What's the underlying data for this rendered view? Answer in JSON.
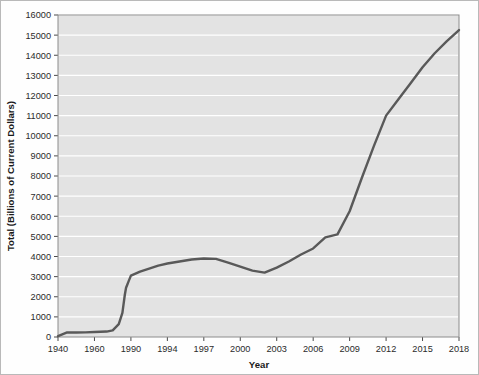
{
  "chart_data": {
    "type": "line",
    "title": "",
    "xlabel": "Year",
    "ylabel": "Total (Billions of Current Dollars)",
    "xlim": [
      1940,
      2019
    ],
    "ylim": [
      0,
      16000
    ],
    "grid": true,
    "legend": "none",
    "line_color": "#595959",
    "plot_bg_color": "#e3e3e3",
    "grid_color": "#ffffff",
    "frame_color": "#b9b9b9",
    "y_ticks": [
      0,
      1000,
      2000,
      3000,
      4000,
      5000,
      6000,
      7000,
      8000,
      9000,
      10000,
      11000,
      12000,
      13000,
      14000,
      15000,
      16000
    ],
    "y_tick_labels": [
      "0",
      "1000",
      "2000",
      "3000",
      "4000",
      "5000",
      "6000",
      "7000",
      "8000",
      "9000",
      "10000",
      "11000",
      "12000",
      "13000",
      "14000",
      "15000",
      "16000"
    ],
    "x_ticks": [
      1940,
      1960,
      1990,
      1994,
      1997,
      2000,
      2003,
      2006,
      2009,
      2012,
      2015,
      2018
    ],
    "x_tick_labels": [
      "1940",
      "1960",
      "1990",
      "1994",
      "1997",
      "2000",
      "2003",
      "2006",
      "2009",
      "2012",
      "2015",
      "2018"
    ],
    "x": [
      1940,
      1945,
      1950,
      1955,
      1960,
      1965,
      1970,
      1975,
      1980,
      1983,
      1985,
      1986,
      1987,
      1988,
      1989,
      1990,
      1991,
      1992,
      1993,
      1994,
      1995,
      1996,
      1997,
      1998,
      1999,
      2000,
      2001,
      2002,
      2003,
      2004,
      2005,
      2006,
      2007,
      2008,
      2009,
      2010,
      2011,
      2012,
      2013,
      2014,
      2015,
      2016,
      2017,
      2018
    ],
    "y": [
      40,
      230,
      220,
      230,
      250,
      260,
      270,
      330,
      640,
      1200,
      2100,
      2450,
      2600,
      2750,
      2900,
      3050,
      3250,
      3400,
      3550,
      3650,
      3750,
      3850,
      3900,
      3880,
      3700,
      3500,
      3300,
      3200,
      3450,
      3750,
      4100,
      4400,
      4950,
      5100,
      6250,
      7900,
      9500,
      11000,
      11800,
      12600,
      13400,
      14100,
      14700,
      15250
    ],
    "series": [
      {
        "name": "Total",
        "values": [
          40,
          230,
          220,
          230,
          250,
          260,
          270,
          330,
          640,
          1200,
          2100,
          2450,
          2600,
          2750,
          2900,
          3050,
          3250,
          3400,
          3550,
          3650,
          3750,
          3850,
          3900,
          3880,
          3700,
          3500,
          3300,
          3200,
          3450,
          3750,
          4100,
          4400,
          4950,
          5100,
          6250,
          7900,
          9500,
          11000,
          11800,
          12600,
          13400,
          14100,
          14700,
          15250
        ]
      }
    ]
  }
}
